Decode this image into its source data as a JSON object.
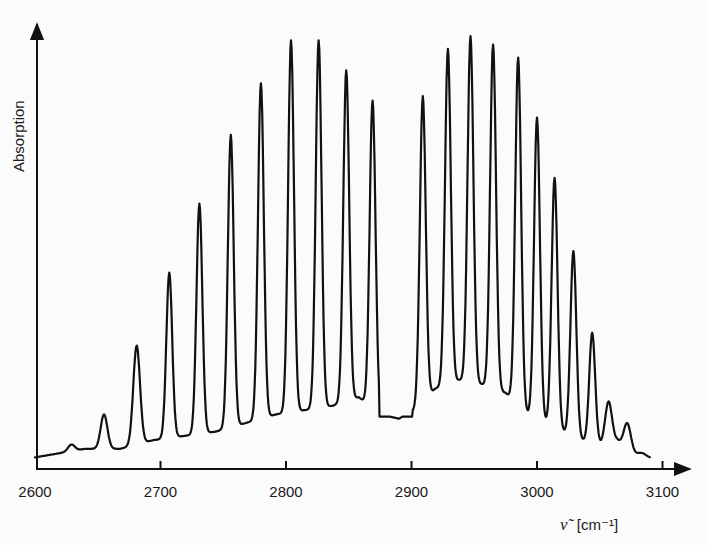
{
  "chart_data": {
    "type": "line",
    "title": "",
    "xlabel": "ν̃ [cm⁻¹]",
    "ylabel": "Absorption",
    "xlim": [
      2600,
      3100
    ],
    "ylim": [
      0,
      1
    ],
    "grid": false,
    "legend": null,
    "x_ticks": [
      2600,
      2700,
      2800,
      2900,
      3000,
      3100
    ],
    "x_tick_labels": [
      "2600",
      "2700",
      "2800",
      "2900",
      "3000",
      "3100"
    ],
    "y_ticks": [],
    "annotations": [
      "P-branch (2600–2880)",
      "R-branch (2900–3090)",
      "gap at band center ~2886"
    ],
    "peaks": {
      "x": [
        2629,
        2655,
        2681,
        2707,
        2731,
        2756,
        2780,
        2804,
        2826,
        2848,
        2869,
        2909,
        2929,
        2947,
        2965,
        2985,
        3000,
        3014,
        3029,
        3044,
        3057,
        3072,
        3084
      ],
      "y": [
        0.05,
        0.12,
        0.28,
        0.45,
        0.61,
        0.77,
        0.89,
        0.99,
        0.99,
        0.92,
        0.85,
        0.86,
        0.97,
        1.0,
        0.98,
        0.95,
        0.81,
        0.67,
        0.5,
        0.31,
        0.15,
        0.1,
        0.03
      ]
    },
    "baseline": {
      "x": [
        2600,
        2640,
        2668,
        2694,
        2719,
        2744,
        2768,
        2792,
        2815,
        2837,
        2858,
        2875,
        2890,
        2902,
        2919,
        2938,
        2956,
        2975,
        2993,
        3007,
        3021,
        3036,
        3051,
        3064,
        3078,
        3090
      ],
      "y": [
        0.02,
        0.04,
        0.04,
        0.06,
        0.07,
        0.08,
        0.1,
        0.12,
        0.13,
        0.14,
        0.16,
        0.12,
        0.11,
        0.13,
        0.18,
        0.2,
        0.19,
        0.17,
        0.12,
        0.1,
        0.08,
        0.06,
        0.05,
        0.06,
        0.03,
        0.02
      ]
    }
  },
  "axes": {
    "y_label": "Absorption",
    "x_label_symbol": "ν̃",
    "x_label_unit": "[cm⁻¹]",
    "x_tick_labels": [
      "2600",
      "2700",
      "2800",
      "2900",
      "3000",
      "3100"
    ]
  },
  "colors": {
    "line": "#111111",
    "background": "#fbfbfb",
    "text": "#1a1a1a"
  }
}
